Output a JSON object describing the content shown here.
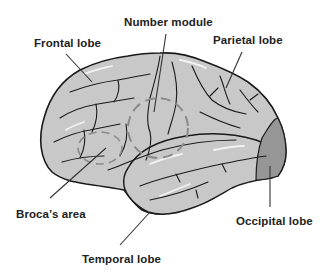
{
  "diagram": {
    "type": "anatomical-illustration",
    "colors": {
      "brain_fill": "#c8c8c8",
      "occipital_fill": "#969696",
      "outline": "#1a1a1a",
      "sulci": "#1a1a1a",
      "highlight": "#f2f2f2",
      "number_module_circle": "#8a8a8a",
      "label_text": "#222222",
      "leader_line": "#333333"
    },
    "labels": [
      {
        "id": "number-module",
        "text": "Number module"
      },
      {
        "id": "frontal-lobe",
        "text": "Frontal lobe"
      },
      {
        "id": "parietal-lobe",
        "text": "Parietal lobe"
      },
      {
        "id": "brocas-area",
        "text": "Broca’s area"
      },
      {
        "id": "occipital-lobe",
        "text": "Occipital lobe"
      },
      {
        "id": "temporal-lobe",
        "text": "Temporal lobe"
      }
    ]
  }
}
